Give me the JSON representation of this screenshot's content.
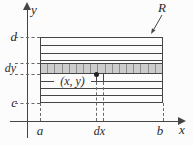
{
  "figure": {
    "background": "#fcfcfc",
    "line_color": "#454545",
    "dash_color": "#6a6a6a",
    "strip_fill": "#cccccc",
    "strip_cell_border": "#8d8d8d",
    "strip_cells": 17
  },
  "labels": {
    "y_axis": "y",
    "x_axis": "x",
    "top_bound": "d",
    "strip_height": "dy",
    "bottom_bound": "c",
    "left_bound": "a",
    "strip_width": "dx",
    "right_bound": "b",
    "region": "R",
    "sample_point": "(x, y)"
  }
}
